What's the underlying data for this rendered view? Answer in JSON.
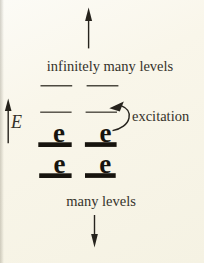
{
  "figure": {
    "type": "energy-level-diagram",
    "background_color": "#f9f6ea",
    "ink_color": "#35322a",
    "level_bar_color": "#17140e",
    "labels": {
      "top_region": "infinitely many levels",
      "bottom_region": "many levels",
      "transition": "excitation",
      "energy_axis": "E"
    },
    "electron_symbol": "e",
    "unoccupied_level_lines": 4,
    "occupied_level_bars": 4,
    "electron_count": 4
  }
}
